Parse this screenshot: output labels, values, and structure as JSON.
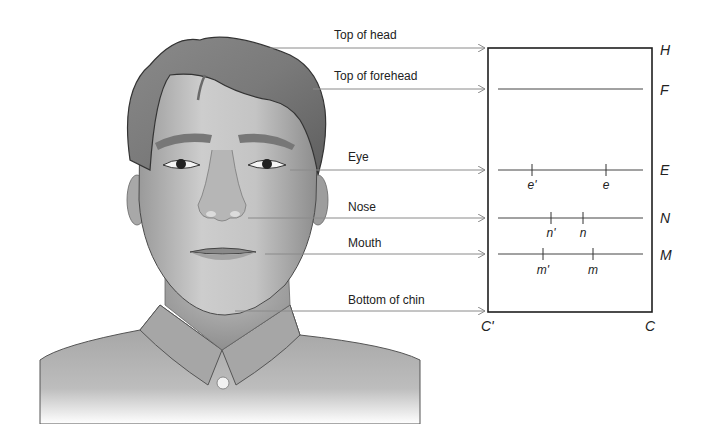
{
  "figure": {
    "colors": {
      "arrow_line": "#8a8a8a",
      "rect_line": "#1e1e1e",
      "inner_line": "#444444",
      "text": "#222222",
      "skin_light": "#c8c8c8",
      "skin_mid": "#a8a8a8",
      "hair": "#7a7a7a",
      "shirt": "#b0b0b0"
    }
  },
  "landmarks": [
    {
      "id": "top-of-head",
      "label": "Top of head",
      "y": 48,
      "x_start": 270,
      "label_x": 334,
      "label_y": 28
    },
    {
      "id": "top-of-forehead",
      "label": "Top of forehead",
      "y": 89,
      "x_start": 313,
      "label_x": 334,
      "label_y": 69
    },
    {
      "id": "eye",
      "label": "Eye",
      "y": 170,
      "x_start": 290,
      "label_x": 348,
      "label_y": 150
    },
    {
      "id": "nose",
      "label": "Nose",
      "y": 218,
      "x_start": 248,
      "label_x": 348,
      "label_y": 200
    },
    {
      "id": "mouth",
      "label": "Mouth",
      "y": 254,
      "x_start": 265,
      "label_x": 348,
      "label_y": 236
    },
    {
      "id": "bottom-of-chin",
      "label": "Bottom of chin",
      "y": 311,
      "x_start": 235,
      "label_x": 348,
      "label_y": 293
    }
  ],
  "diagram": {
    "rect": {
      "x1": 488,
      "y1": 48,
      "x2": 652,
      "y2": 312
    },
    "corner_labels": {
      "H": {
        "text": "H",
        "x": 660,
        "y": 42
      },
      "F": {
        "text": "F",
        "x": 660,
        "y": 82
      },
      "E": {
        "text": "E",
        "x": 660,
        "y": 162
      },
      "N": {
        "text": "N",
        "x": 660,
        "y": 210
      },
      "M": {
        "text": "M",
        "x": 660,
        "y": 247
      },
      "C_prime": {
        "text": "C'",
        "x": 481,
        "y": 318
      },
      "C": {
        "text": "C",
        "x": 645,
        "y": 318
      }
    },
    "inner_lines": [
      {
        "id": "forehead-line",
        "y": 89,
        "x1": 498,
        "x2": 643,
        "ticks": []
      },
      {
        "id": "eye-line",
        "y": 170,
        "x1": 498,
        "x2": 643,
        "ticks": [
          {
            "x": 532,
            "label": "e'"
          },
          {
            "x": 606,
            "label": "e"
          }
        ]
      },
      {
        "id": "nose-line",
        "y": 218,
        "x1": 498,
        "x2": 643,
        "ticks": [
          {
            "x": 551,
            "label": "n'"
          },
          {
            "x": 583,
            "label": "n"
          }
        ]
      },
      {
        "id": "mouth-line",
        "y": 254,
        "x1": 498,
        "x2": 643,
        "ticks": [
          {
            "x": 543,
            "label": "m'"
          },
          {
            "x": 593,
            "label": "m"
          }
        ]
      }
    ]
  },
  "text": {
    "top_of_head": "Top of head",
    "top_of_forehead": "Top of forehead",
    "eye": "Eye",
    "nose": "Nose",
    "mouth": "Mouth",
    "bottom_of_chin": "Bottom of chin",
    "H": "H",
    "F": "F",
    "E": "E",
    "N": "N",
    "M": "M",
    "C_prime": "C'",
    "C": "C",
    "e_prime": "e'",
    "e": "e",
    "n_prime": "n'",
    "n": "n",
    "m_prime": "m'",
    "m": "m"
  }
}
